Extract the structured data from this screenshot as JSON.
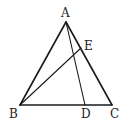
{
  "diagram": {
    "type": "geometry",
    "stroke_color": "#1a1a1a",
    "points": {
      "A": {
        "label": "A",
        "x": 66,
        "y": 22,
        "label_x": 61,
        "label_y": 17
      },
      "B": {
        "label": "B",
        "x": 20,
        "y": 105,
        "label_x": 9,
        "label_y": 118
      },
      "C": {
        "label": "C",
        "x": 112,
        "y": 105,
        "label_x": 110,
        "label_y": 118
      },
      "D": {
        "label": "D",
        "x": 85,
        "y": 105,
        "label_x": 81,
        "label_y": 118
      },
      "E": {
        "label": "E",
        "x": 81,
        "y": 48,
        "label_x": 84,
        "label_y": 50
      }
    },
    "segments": [
      {
        "from": "A",
        "to": "B",
        "weight": "thick"
      },
      {
        "from": "A",
        "to": "C",
        "weight": "thick"
      },
      {
        "from": "B",
        "to": "C",
        "weight": "thick"
      },
      {
        "from": "A",
        "to": "D",
        "weight": "thin"
      },
      {
        "from": "B",
        "to": "E",
        "weight": "thin"
      }
    ]
  }
}
